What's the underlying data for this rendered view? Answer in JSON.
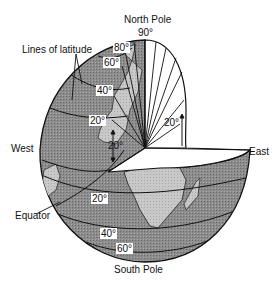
{
  "diagram": {
    "labels": {
      "north_pole": "North Pole",
      "south_pole": "South Pole",
      "east": "East",
      "west": "West",
      "equator": "Equator",
      "lines_of_latitude": "Lines of latitude"
    },
    "latitude_marks_north": [
      "90°",
      "80°",
      "60°",
      "40°",
      "20°"
    ],
    "latitude_marks_south": [
      "20°",
      "40°",
      "60°"
    ],
    "angle_marks": {
      "inner_left": "20°",
      "inner_right": "20°"
    },
    "colors": {
      "ocean": "#8a8a8a",
      "land": "#c4c4c4",
      "cutaway": "#ffffff",
      "line": "#111111"
    }
  }
}
